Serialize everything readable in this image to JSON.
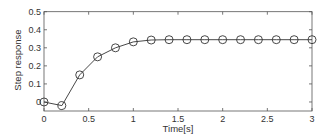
{
  "chart_data": {
    "type": "line",
    "title": "",
    "xlabel": "Time[s]",
    "ylabel": "Step response",
    "xlim": [
      0,
      3
    ],
    "ylim": [
      -0.05,
      0.5
    ],
    "xticks": [
      0,
      0.5,
      1,
      1.5,
      2,
      2.5,
      3
    ],
    "xtick_labels": [
      "0",
      "0.5",
      "1",
      "1.5",
      "2",
      "2.5",
      "3"
    ],
    "yticks": [
      0,
      0.1,
      0.2,
      0.3,
      0.4,
      0.5
    ],
    "ytick_labels": [
      "0",
      "0.1",
      "0.2",
      "0.3",
      "0.4",
      "0.5"
    ],
    "grid": false,
    "legend": null,
    "series": [
      {
        "name": "Step response",
        "marker": "circle-open",
        "color": "#333333",
        "x": [
          0,
          0.2,
          0.4,
          0.6,
          0.8,
          1.0,
          1.2,
          1.4,
          1.6,
          1.8,
          2.0,
          2.2,
          2.4,
          2.6,
          2.8,
          3.0
        ],
        "y": [
          0,
          -0.02,
          0.15,
          0.25,
          0.3,
          0.333,
          0.343,
          0.345,
          0.345,
          0.345,
          0.345,
          0.345,
          0.345,
          0.345,
          0.345,
          0.345
        ]
      }
    ]
  }
}
